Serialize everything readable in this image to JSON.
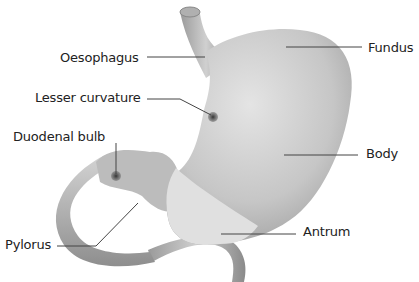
{
  "diagram": {
    "labels": [
      {
        "id": "oesophagus",
        "text": "Oesophagus",
        "x": 60,
        "y": 51,
        "line": [
          [
            147,
            57
          ],
          [
            205,
            57
          ]
        ]
      },
      {
        "id": "lesser-curvature",
        "text": "Lesser curvature",
        "x": 35,
        "y": 91,
        "line": [
          [
            147,
            99
          ],
          [
            180,
            99
          ],
          [
            211,
            115
          ]
        ]
      },
      {
        "id": "duodenal-bulb",
        "text": "Duodenal bulb",
        "x": 13,
        "y": 130,
        "line": [
          [
            116,
            143
          ],
          [
            116,
            174
          ]
        ]
      },
      {
        "id": "pylorus",
        "text": "Pylorus",
        "x": 5,
        "y": 238,
        "line": [
          [
            57,
            246
          ],
          [
            96,
            246
          ],
          [
            138,
            203
          ]
        ]
      },
      {
        "id": "fundus",
        "text": "Fundus",
        "x": 368,
        "y": 41,
        "line": [
          [
            286,
            47
          ],
          [
            362,
            47
          ]
        ]
      },
      {
        "id": "body",
        "text": "Body",
        "x": 366,
        "y": 147,
        "line": [
          [
            284,
            155
          ],
          [
            358,
            155
          ]
        ]
      },
      {
        "id": "antrum",
        "text": "Antrum",
        "x": 303,
        "y": 225,
        "line": [
          [
            221,
            234
          ],
          [
            296,
            234
          ]
        ]
      }
    ]
  },
  "colors": {
    "stomach_body": "#bdbdbd",
    "stomach_light": "#dcdcdc",
    "antrum": "#e2e2e2",
    "duodenum": "#b5b5b5",
    "dots": "#4a4a4a",
    "leader_lines": "#444444",
    "text": "#222222"
  }
}
